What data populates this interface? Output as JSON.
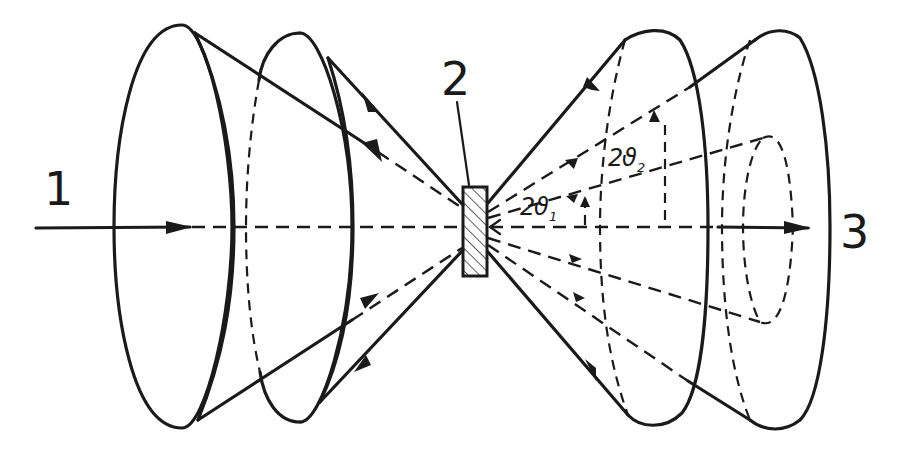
{
  "diagram": {
    "labels": {
      "incident_beam": "1",
      "sample": "2",
      "transmitted_beam": "3",
      "angle1_main": "2",
      "angle1_symbol": "ϑ",
      "angle1_sub": "1",
      "angle2_main": "2",
      "angle2_symbol": "ϑ",
      "angle2_sub": "2"
    },
    "elements": [
      "incident beam with arrow",
      "hatched sample",
      "two back-reflection cones (left)",
      "two forward-diffraction cones (right)",
      "inner dashed cone",
      "transmitted beam with arrow"
    ],
    "colors": {
      "ink": "#1a1a1a",
      "background": "#ffffff"
    }
  }
}
